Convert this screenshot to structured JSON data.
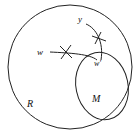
{
  "diagram": {
    "labels": {
      "region_R": "R",
      "region_M": "M",
      "point_w": "w",
      "point_w_prime": "w'",
      "point_y": "y"
    },
    "colors": {
      "stroke": "#222222",
      "background": "#ffffff"
    }
  }
}
